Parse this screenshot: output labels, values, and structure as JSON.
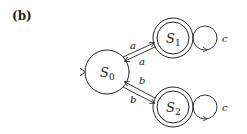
{
  "figure_label": "(b)",
  "diagram": {
    "type": "finite-state-automaton",
    "states": [
      {
        "id": "S0",
        "label": "S",
        "sub": "0",
        "initial": true,
        "accepting": false
      },
      {
        "id": "S1",
        "label": "S",
        "sub": "1",
        "initial": false,
        "accepting": true
      },
      {
        "id": "S2",
        "label": "S",
        "sub": "2",
        "initial": false,
        "accepting": true
      }
    ],
    "transitions": [
      {
        "from": "S0",
        "to": "S1",
        "label": "a"
      },
      {
        "from": "S1",
        "to": "S0",
        "label": "a"
      },
      {
        "from": "S2",
        "to": "S0",
        "label": "b"
      },
      {
        "from": "S0",
        "to": "S2",
        "label": "b"
      },
      {
        "from": "S1",
        "to": "S1",
        "label": "c"
      },
      {
        "from": "S2",
        "to": "S2",
        "label": "c"
      }
    ]
  }
}
